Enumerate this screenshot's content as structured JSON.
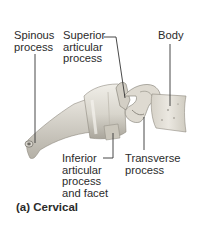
{
  "figure": {
    "caption": "(a) Cervical",
    "labels": {
      "spinous_process": "Spinous\nprocess",
      "superior_articular_process": "Superior\narticular\nprocess",
      "body": "Body",
      "inferior_articular_process": "Inferior\narticular\nprocess\nand facet",
      "transverse_process": "Transverse\nprocess"
    },
    "colors": {
      "bone_light": "#e6e3da",
      "bone_mid": "#c9c5b9",
      "bone_dark": "#8e8a80",
      "leader_line": "#333333",
      "text": "#2b2b2b"
    }
  }
}
